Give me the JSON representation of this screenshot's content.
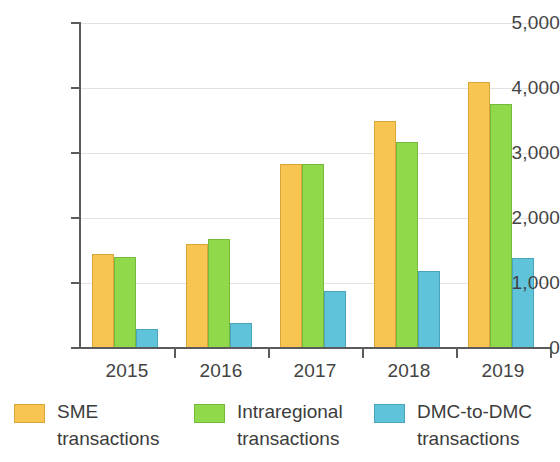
{
  "chart_data": {
    "type": "bar",
    "title": "",
    "subtitle": "",
    "xlabel": "",
    "ylabel": "",
    "categories": [
      "2015",
      "2016",
      "2017",
      "2018",
      "2019"
    ],
    "ylim": [
      0,
      5000
    ],
    "yticks": [
      0,
      1000,
      2000,
      3000,
      4000,
      5000
    ],
    "ytick_labels": [
      "0",
      "1,000",
      "2,000",
      "3,000",
      "4,000",
      "5,000"
    ],
    "grid": true,
    "legend_position": "bottom",
    "series": [
      {
        "name": "SME transactions",
        "legend_line1": "SME",
        "legend_line2": "transactions",
        "color": "#F9C552",
        "values": [
          1450,
          1600,
          2830,
          3490,
          4100
        ]
      },
      {
        "name": "Intraregional transactions",
        "legend_line1": "Intraregional",
        "legend_line2": "transactions",
        "color": "#8FD94A",
        "values": [
          1400,
          1680,
          2830,
          3170,
          3750
        ]
      },
      {
        "name": "DMC-to-DMC transactions",
        "legend_line1": "DMC-to-DMC",
        "legend_line2": "transactions",
        "color": "#5FC3DA",
        "values": [
          290,
          385,
          880,
          1185,
          1385
        ]
      }
    ]
  }
}
